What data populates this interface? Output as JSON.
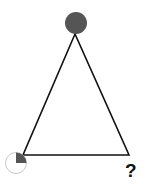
{
  "diagram": {
    "type": "triangle-pattern-puzzle",
    "colors": {
      "line": "#111111",
      "fill_dark": "#555555",
      "outline_light": "#cccccc",
      "background": "#ffffff"
    },
    "vertices": {
      "top": {
        "shape": "circle",
        "fill": "full",
        "description": "fully filled dark gray circle"
      },
      "bottom_left": {
        "shape": "circle",
        "fill": "quarter",
        "description": "circle with top-right quarter filled"
      },
      "bottom_right": {
        "shape": "unknown",
        "label": "?"
      }
    },
    "question_mark": "?"
  }
}
